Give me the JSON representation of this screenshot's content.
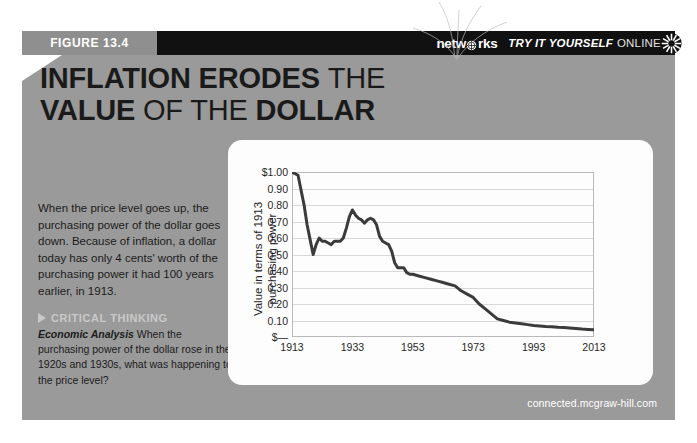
{
  "figure": {
    "tab_label": "FIGURE 13.4"
  },
  "header": {
    "logo_text_before": "netw",
    "logo_globe_icon": "globe-icon",
    "logo_text_after": "rks",
    "try_it_italic": "TRY IT YOURSELF",
    "try_it_plain": "ONLINE",
    "sunburst_icon": "sunburst-icon"
  },
  "title": {
    "line1_bold": "INFLATION ERODES",
    "line1_light": "THE",
    "line2_bold1": "VALUE",
    "line2_light": "OF THE",
    "line2_bold2": "DOLLAR"
  },
  "body": {
    "paragraph": "When the price level goes up, the purchasing power of the dollar goes down. Because of inflation, a dollar today has only 4 cents' worth of the purchasing power it had 100 years earlier, in 1913.",
    "critical_thinking_label": "CRITICAL THINKING",
    "analysis_lead": "Economic Analysis",
    "analysis_text": "When the purchasing power of the dollar rose in the 1920s and 1930s, what was happening to the price level?"
  },
  "footer": {
    "url": "connected.mcgraw-hill.com"
  },
  "colors": {
    "panel_grey": "#9a9a9a",
    "tab_grey": "#8f8f8f",
    "band_black": "#111111",
    "line_color": "#3b3b3b",
    "grid_color": "#d8d8d8",
    "card_white": "#fdfdfd"
  },
  "chart_data": {
    "type": "line",
    "title": "",
    "xlabel": "",
    "ylabel": "Value in terms of 1913 purchasing power",
    "xlim": [
      1913,
      2013
    ],
    "ylim": [
      0,
      1.0
    ],
    "grid": true,
    "legend": "none",
    "ytick_labels": [
      "$1.00",
      "0.90",
      "0.80",
      "0.70",
      "0.60",
      "0.50",
      "0.40",
      "0.30",
      "0.20",
      "0.10",
      "$—"
    ],
    "ytick_values": [
      1.0,
      0.9,
      0.8,
      0.7,
      0.6,
      0.5,
      0.4,
      0.3,
      0.2,
      0.1,
      0.0
    ],
    "xtick_labels": [
      "1913",
      "1933",
      "1953",
      "1973",
      "1993",
      "2013"
    ],
    "xtick_values": [
      1913,
      1933,
      1953,
      1973,
      1993,
      2013
    ],
    "series": [
      {
        "name": "Value of the dollar (1913 = $1.00)",
        "x": [
          1913,
          1915,
          1917,
          1918,
          1919,
          1920,
          1921,
          1922,
          1923,
          1924,
          1925,
          1926,
          1927,
          1928,
          1929,
          1930,
          1931,
          1932,
          1933,
          1934,
          1935,
          1936,
          1937,
          1938,
          1939,
          1940,
          1941,
          1942,
          1943,
          1944,
          1945,
          1946,
          1947,
          1948,
          1949,
          1950,
          1951,
          1952,
          1953,
          1955,
          1957,
          1959,
          1961,
          1963,
          1965,
          1967,
          1969,
          1971,
          1973,
          1975,
          1977,
          1979,
          1981,
          1983,
          1985,
          1987,
          1989,
          1991,
          1993,
          1995,
          1997,
          1999,
          2001,
          2003,
          2005,
          2007,
          2009,
          2011,
          2013
        ],
        "y": [
          1.0,
          0.98,
          0.8,
          0.68,
          0.59,
          0.5,
          0.56,
          0.6,
          0.58,
          0.58,
          0.57,
          0.56,
          0.58,
          0.58,
          0.58,
          0.6,
          0.66,
          0.73,
          0.77,
          0.74,
          0.72,
          0.71,
          0.69,
          0.71,
          0.72,
          0.71,
          0.68,
          0.61,
          0.58,
          0.57,
          0.56,
          0.52,
          0.45,
          0.42,
          0.42,
          0.42,
          0.39,
          0.38,
          0.38,
          0.37,
          0.36,
          0.35,
          0.34,
          0.33,
          0.32,
          0.31,
          0.28,
          0.26,
          0.24,
          0.2,
          0.17,
          0.14,
          0.11,
          0.1,
          0.09,
          0.085,
          0.08,
          0.075,
          0.07,
          0.067,
          0.064,
          0.062,
          0.059,
          0.057,
          0.054,
          0.051,
          0.048,
          0.046,
          0.044
        ]
      }
    ],
    "annotations": []
  }
}
